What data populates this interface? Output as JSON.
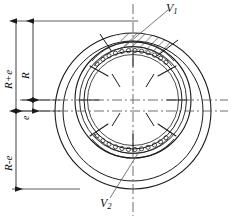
{
  "drawing": {
    "title": "Eccentric vane machine cross-section",
    "line_color": "#1a1a1a",
    "centerline_color": "#555555",
    "hatch_color": "#1a1a1a",
    "background": "#ffffff"
  },
  "dimensions": [
    {
      "id": "R_plus_e",
      "label": "R+e",
      "base": "R",
      "suffix": "+e",
      "orientation": "vertical-rotated",
      "position": "outer-left-upper"
    },
    {
      "id": "R",
      "label": "R",
      "base": "R",
      "suffix": "",
      "orientation": "vertical-rotated",
      "position": "inner-left-upper"
    },
    {
      "id": "e",
      "label": "e",
      "base": "e",
      "suffix": "",
      "orientation": "vertical-rotated",
      "position": "inner-left-middle"
    },
    {
      "id": "R_minus_e",
      "label": "R-e",
      "base": "R",
      "suffix": "-e",
      "orientation": "vertical-rotated",
      "position": "outer-left-lower"
    }
  ],
  "callouts": [
    {
      "id": "V1",
      "base": "V",
      "sub": "1",
      "label": "V1",
      "position": "top-right",
      "leader": "to-hatched-sector"
    },
    {
      "id": "V2",
      "base": "V",
      "sub": "2",
      "label": "V2",
      "position": "bottom-center",
      "leader": "to-lower-chamber"
    }
  ],
  "features": {
    "stator_outer_ring": "outer-circle",
    "stator_inner_ring": "second-circle",
    "rotor_outer_ring": "rotor-circle",
    "rotor_bore": "inner-bore-circle",
    "vane_count": 8,
    "roller_bands": [
      "top-roller-band",
      "bottom-roller-band"
    ],
    "section_hatch": "top-wedge-hatched",
    "centerlines": [
      "vertical-centerline",
      "stator-horizontal-centerline",
      "rotor-horizontal-centerline"
    ]
  }
}
